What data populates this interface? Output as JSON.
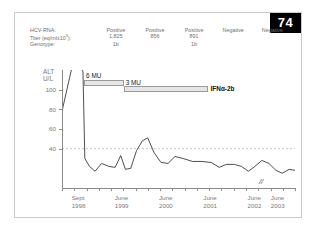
{
  "page": {
    "badge_number": "74"
  },
  "serology": {
    "rows": [
      {
        "label": "HCV-RNA:",
        "values": [
          "Positive",
          "Positive",
          "Positive",
          "Negative",
          "Negative"
        ]
      },
      {
        "label": "Titer (eq/mlx10",
        "label_sup": "3",
        "label_tail": "):",
        "values": [
          "1,825",
          "856",
          "891",
          "",
          ""
        ]
      },
      {
        "label": "Genotype:",
        "values": [
          "1b",
          "",
          "1b",
          "",
          ""
        ]
      }
    ]
  },
  "chart_data": {
    "type": "line",
    "title": "",
    "ylabel": "ALT U/L",
    "ylabel_lines": [
      "ALT",
      "U/L"
    ],
    "xlabel": "",
    "ylim": [
      0,
      120
    ],
    "yticks": [
      40,
      60,
      80,
      100
    ],
    "grid": false,
    "reference_line": {
      "value": 40,
      "style": "dashed",
      "color": "#b9b9b9"
    },
    "xtick_labels": [
      {
        "line1": "Sept",
        "line2": "1998",
        "x": 0.05
      },
      {
        "line1": "June",
        "line2": "1999",
        "x": 0.235
      },
      {
        "line1": "June",
        "line2": "2000",
        "x": 0.425
      },
      {
        "line1": "June",
        "line2": "2001",
        "x": 0.615
      },
      {
        "line1": "June",
        "line2": "2002",
        "x": 0.805
      },
      {
        "line1": "June",
        "line2": "2003",
        "x": 0.905
      }
    ],
    "axis_break_marker": "//",
    "series": [
      {
        "name": "ALT",
        "points": [
          {
            "x": 0.0,
            "y": 78
          },
          {
            "x": 0.04,
            "y": 120
          },
          {
            "x": 0.075,
            "y": 126
          },
          {
            "x": 0.09,
            "y": 118
          },
          {
            "x": 0.098,
            "y": 30
          },
          {
            "x": 0.118,
            "y": 22
          },
          {
            "x": 0.142,
            "y": 17
          },
          {
            "x": 0.17,
            "y": 25
          },
          {
            "x": 0.2,
            "y": 22
          },
          {
            "x": 0.228,
            "y": 21
          },
          {
            "x": 0.252,
            "y": 33
          },
          {
            "x": 0.272,
            "y": 19
          },
          {
            "x": 0.295,
            "y": 20
          },
          {
            "x": 0.32,
            "y": 38
          },
          {
            "x": 0.345,
            "y": 48
          },
          {
            "x": 0.368,
            "y": 51
          },
          {
            "x": 0.395,
            "y": 36
          },
          {
            "x": 0.425,
            "y": 26
          },
          {
            "x": 0.455,
            "y": 25
          },
          {
            "x": 0.485,
            "y": 32
          },
          {
            "x": 0.52,
            "y": 30
          },
          {
            "x": 0.56,
            "y": 27
          },
          {
            "x": 0.6,
            "y": 27
          },
          {
            "x": 0.64,
            "y": 26
          },
          {
            "x": 0.675,
            "y": 21
          },
          {
            "x": 0.705,
            "y": 24
          },
          {
            "x": 0.74,
            "y": 24
          },
          {
            "x": 0.77,
            "y": 22
          },
          {
            "x": 0.8,
            "y": 17
          },
          {
            "x": 0.828,
            "y": 22
          },
          {
            "x": 0.858,
            "y": 28
          },
          {
            "x": 0.888,
            "y": 25
          },
          {
            "x": 0.918,
            "y": 18
          },
          {
            "x": 0.945,
            "y": 15
          },
          {
            "x": 0.975,
            "y": 19
          },
          {
            "x": 1.0,
            "y": 18
          }
        ]
      }
    ],
    "annotations": [
      {
        "name": "dose-6mu",
        "label": "6 MU",
        "bar_x_start": 0.095,
        "bar_x_end": 0.265,
        "bar_y": 110
      },
      {
        "name": "dose-3mu",
        "label": "3 MU",
        "bar_x_start": 0.265,
        "bar_x_end": 0.625,
        "bar_y": 104
      },
      {
        "name": "drug-name",
        "label": "IFNα-2b"
      }
    ]
  }
}
